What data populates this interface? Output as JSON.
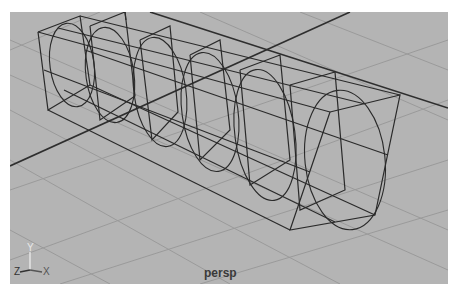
{
  "viewport": {
    "camera_label": "persp",
    "axis_labels": {
      "y": "Y",
      "z": "Z",
      "x": "X"
    },
    "background_color": "#b4b4b4",
    "grid_color": "#9a9a9a",
    "wire_color": "#2a2a2a",
    "object": "wireframe box with cylinder inside"
  }
}
